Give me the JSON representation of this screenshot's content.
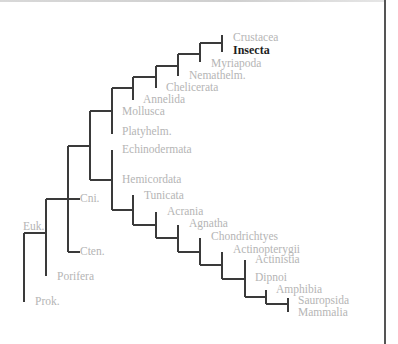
{
  "diagram": {
    "type": "phylogenetic-tree",
    "colors": {
      "branch": "#3a3a3a",
      "label": "#b5b5b5",
      "highlight_label": "#1e1e1e",
      "border": "#555555"
    },
    "highlighted_taxon": "Insecta",
    "labels": [
      {
        "id": "crustacea",
        "text": "Crustacea",
        "x": 233,
        "y": 38,
        "highlight": false
      },
      {
        "id": "insecta",
        "text": "Insecta",
        "x": 233,
        "y": 51,
        "highlight": true
      },
      {
        "id": "myriapoda",
        "text": "Myriapoda",
        "x": 211,
        "y": 64,
        "highlight": false
      },
      {
        "id": "nemathelm",
        "text": "Nemathelm.",
        "x": 189,
        "y": 76,
        "highlight": false
      },
      {
        "id": "chelicerata",
        "text": "Chelicerata",
        "x": 166,
        "y": 88,
        "highlight": false
      },
      {
        "id": "annelida",
        "text": "Annelida",
        "x": 143,
        "y": 100,
        "highlight": false
      },
      {
        "id": "mollusca",
        "text": "Mollusca",
        "x": 122,
        "y": 112,
        "highlight": false
      },
      {
        "id": "platyhelm",
        "text": "Platyhelm.",
        "x": 122,
        "y": 132,
        "highlight": false
      },
      {
        "id": "echinodermata",
        "text": "Echinodermata",
        "x": 122,
        "y": 150,
        "highlight": false
      },
      {
        "id": "hemicordata",
        "text": "Hemicordata",
        "x": 122,
        "y": 180,
        "highlight": false
      },
      {
        "id": "tunicata",
        "text": "Tunicata",
        "x": 144,
        "y": 196,
        "highlight": false
      },
      {
        "id": "acrania",
        "text": "Acrania",
        "x": 167,
        "y": 212,
        "highlight": false
      },
      {
        "id": "agnatha",
        "text": "Agnatha",
        "x": 189,
        "y": 224,
        "highlight": false
      },
      {
        "id": "chondrichtyes",
        "text": "Chondrichtyes",
        "x": 211,
        "y": 237,
        "highlight": false
      },
      {
        "id": "actinopterygii",
        "text": "Actinopterygii",
        "x": 233,
        "y": 250,
        "highlight": false
      },
      {
        "id": "actinistia",
        "text": "Actinistia",
        "x": 255,
        "y": 260,
        "highlight": false
      },
      {
        "id": "dipnoi",
        "text": "Dipnoi",
        "x": 255,
        "y": 278,
        "highlight": false
      },
      {
        "id": "amphibia",
        "text": "Amphibia",
        "x": 276,
        "y": 290,
        "highlight": false
      },
      {
        "id": "sauropsida",
        "text": "Sauropsida",
        "x": 298,
        "y": 301,
        "highlight": false
      },
      {
        "id": "mammalia",
        "text": "Mammalia",
        "x": 298,
        "y": 313,
        "highlight": false
      },
      {
        "id": "cni",
        "text": "Cni.",
        "x": 80,
        "y": 199,
        "highlight": false
      },
      {
        "id": "cten",
        "text": "Cten.",
        "x": 80,
        "y": 252,
        "highlight": false
      },
      {
        "id": "euk",
        "text": "Euk.",
        "x": 23,
        "y": 227,
        "highlight": false
      },
      {
        "id": "porifera",
        "text": "Porifera",
        "x": 57,
        "y": 277,
        "highlight": false
      },
      {
        "id": "prok",
        "text": "Prok.",
        "x": 35,
        "y": 302,
        "highlight": false
      }
    ],
    "branches": [
      [
        222,
        35,
        222,
        52
      ],
      [
        200,
        43,
        222,
        43
      ],
      [
        200,
        43,
        200,
        62
      ],
      [
        178,
        54,
        200,
        54
      ],
      [
        178,
        54,
        178,
        76
      ],
      [
        156,
        66,
        178,
        66
      ],
      [
        156,
        66,
        156,
        88
      ],
      [
        133,
        77,
        156,
        77
      ],
      [
        133,
        77,
        133,
        100
      ],
      [
        112,
        88,
        133,
        88
      ],
      [
        112,
        88,
        112,
        134
      ],
      [
        90,
        111,
        112,
        111
      ],
      [
        90,
        111,
        90,
        180
      ],
      [
        68,
        146,
        90,
        146
      ],
      [
        68,
        146,
        68,
        252
      ],
      [
        90,
        180,
        112,
        180
      ],
      [
        112,
        150,
        112,
        210
      ],
      [
        112,
        210,
        133,
        210
      ],
      [
        133,
        195,
        133,
        225
      ],
      [
        133,
        225,
        156,
        225
      ],
      [
        156,
        212,
        156,
        238
      ],
      [
        156,
        238,
        178,
        238
      ],
      [
        178,
        225,
        178,
        252
      ],
      [
        178,
        252,
        200,
        252
      ],
      [
        200,
        238,
        200,
        265
      ],
      [
        200,
        265,
        222,
        265
      ],
      [
        222,
        252,
        222,
        279
      ],
      [
        222,
        279,
        245,
        279
      ],
      [
        245,
        260,
        245,
        297
      ],
      [
        245,
        297,
        266,
        297
      ],
      [
        266,
        290,
        266,
        304
      ],
      [
        266,
        304,
        288,
        304
      ],
      [
        288,
        298,
        288,
        312
      ],
      [
        46,
        199,
        80,
        199
      ],
      [
        68,
        252,
        80,
        252
      ],
      [
        46,
        199,
        46,
        276
      ],
      [
        24,
        233,
        46,
        233
      ],
      [
        24,
        233,
        24,
        302
      ]
    ]
  }
}
